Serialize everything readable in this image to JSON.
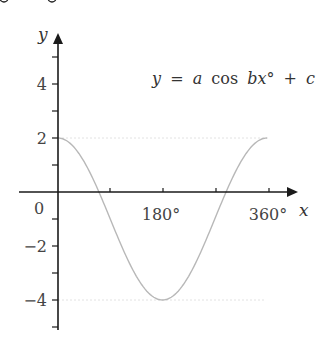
{
  "top_fragment": "cut-off text fragment at top edge",
  "chart_data": {
    "type": "line",
    "title": "",
    "equation": "y = a cos bx° + c",
    "equation_parts": {
      "lhs": "y",
      "eq": "=",
      "a": "a",
      "cos": "cos",
      "b": "b",
      "x": "x",
      "deg": "°",
      "plus": "+",
      "c": "c"
    },
    "xlabel": "x",
    "ylabel": "y",
    "origin_label": "0",
    "x_ticks": [
      90,
      180,
      270,
      360
    ],
    "x_tick_labels": [
      {
        "value": 180,
        "label": "180°"
      },
      {
        "value": 360,
        "label": "360°"
      }
    ],
    "y_ticks": [
      -5,
      -4,
      -3,
      -2,
      -1,
      1,
      2,
      3,
      4,
      5
    ],
    "y_tick_labels": [
      {
        "value": 4,
        "label": "4"
      },
      {
        "value": 2,
        "label": "2"
      },
      {
        "value": -2,
        "label": "−2"
      },
      {
        "value": -4,
        "label": "−4"
      }
    ],
    "xlim": [
      -40,
      360
    ],
    "ylim": [
      -5.5,
      5.7
    ],
    "reference_lines": [
      {
        "y": 2,
        "style": "dotted"
      },
      {
        "y": -4,
        "style": "dotted"
      }
    ],
    "series": [
      {
        "name": "y = 3 cos x° − 1",
        "x": [
          0,
          30,
          60,
          90,
          120,
          150,
          180,
          210,
          240,
          270,
          300,
          330,
          360
        ],
        "values": [
          2,
          1.6,
          0.5,
          -1,
          -2.5,
          -3.6,
          -4,
          -3.6,
          -2.5,
          -1,
          0.5,
          1.6,
          2
        ]
      }
    ],
    "curve_color": "#b8b8b8",
    "axis_color": "#1a1a1a",
    "reference_line_color": "#e0e0e0",
    "grid": false
  }
}
